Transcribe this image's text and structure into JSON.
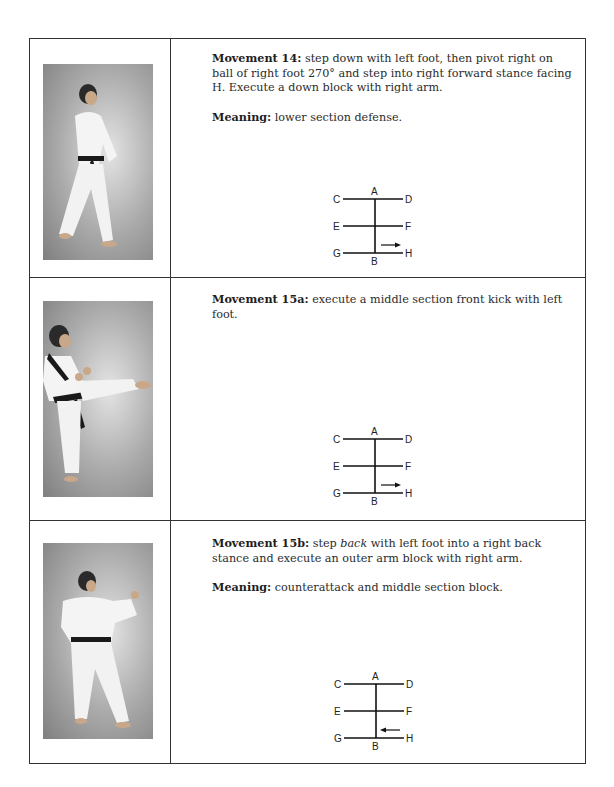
{
  "rows": [
    {
      "photo": {
        "icon": "martial-artist-photo-down-block"
      },
      "movement": {
        "label": "Movement 14:",
        "text": " step down with left foot, then pivot right on ball of right foot 270° and step into right forward stance facing H. Execute a down block with right arm."
      },
      "meaning": {
        "label": "Meaning:",
        "text": " lower section defense."
      },
      "diagram": {
        "labels": {
          "A": "A",
          "B": "B",
          "C": "C",
          "D": "D",
          "E": "E",
          "F": "F",
          "G": "G",
          "H": "H"
        },
        "arrow_direction": "right"
      }
    },
    {
      "photo": {
        "icon": "martial-artist-photo-front-kick"
      },
      "movement": {
        "label": "Movement 15a:",
        "text": " execute a middle section front kick with left foot."
      },
      "diagram": {
        "labels": {
          "A": "A",
          "B": "B",
          "C": "C",
          "D": "D",
          "E": "E",
          "F": "F",
          "G": "G",
          "H": "H"
        },
        "arrow_direction": "right"
      }
    },
    {
      "photo": {
        "icon": "martial-artist-photo-outer-arm-block"
      },
      "movement": {
        "label": "Movement 15b:",
        "text_before": " step ",
        "text_italic": "back",
        "text_after": " with left foot into a right back stance and execute an outer arm block with right arm."
      },
      "meaning": {
        "label": "Meaning:",
        "text": " counterattack and middle section block."
      },
      "diagram": {
        "labels": {
          "A": "A",
          "B": "B",
          "C": "C",
          "D": "D",
          "E": "E",
          "F": "F",
          "G": "G",
          "H": "H"
        },
        "arrow_direction": "left"
      }
    }
  ]
}
